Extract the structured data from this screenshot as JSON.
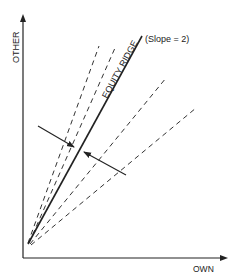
{
  "diagram": {
    "axes": {
      "y_label": "OTHER",
      "x_label": "OWN"
    },
    "ridge": {
      "label": "EQUITY RIDGE",
      "slope_label": "(Slope = 2)"
    },
    "lines": [
      {
        "style": "solid",
        "name": "equity-ridge"
      },
      {
        "style": "dashed",
        "name": "steep-dashed-1"
      },
      {
        "style": "dashed",
        "name": "steep-dashed-2"
      },
      {
        "style": "dashed",
        "name": "shallow-dashed-1"
      },
      {
        "style": "dashed",
        "name": "shallow-dashed-2"
      }
    ],
    "arrows": [
      {
        "direction": "toward-ridge-from-left"
      },
      {
        "direction": "toward-ridge-from-right"
      }
    ],
    "colors": {
      "ink": "#222222",
      "background": "#ffffff"
    }
  }
}
